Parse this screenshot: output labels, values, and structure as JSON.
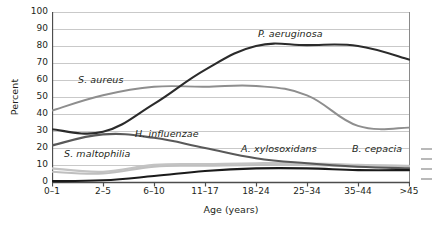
{
  "chart_data": {
    "type": "line",
    "title": "",
    "xlabel": "Age (years)",
    "ylabel": "Percent",
    "categories": [
      "0–1",
      "2–5",
      "6–10",
      "11–17",
      "18–24",
      "25–34",
      "35–44",
      ">45"
    ],
    "ylim": [
      0,
      100
    ],
    "yticks": [
      0,
      10,
      20,
      30,
      40,
      50,
      60,
      70,
      80,
      90,
      100
    ],
    "grid": true,
    "legend_position": "inline-annotations",
    "series": [
      {
        "name": "P. aeruginosa",
        "color": "#2b2b2b",
        "width": 2.1,
        "values": [
          31,
          29.5,
          46,
          66,
          80,
          80.5,
          80,
          72
        ],
        "label_x": 258,
        "label_y": 28
      },
      {
        "name": "S. aureus",
        "color": "#8e8e8e",
        "width": 1.9,
        "values": [
          42,
          51,
          56,
          56,
          56.5,
          51,
          33,
          32
        ],
        "label_x": 78,
        "label_y": 74
      },
      {
        "name": "H. influenzae",
        "color": "#595959",
        "width": 2.1,
        "values": [
          21.5,
          28,
          26,
          20,
          14,
          11,
          9,
          8
        ],
        "label_x": 135,
        "label_y": 128
      },
      {
        "name": "S. maltophilia",
        "color": "#c3c3c3",
        "width": 2.3,
        "values": [
          8,
          6,
          10,
          10.5,
          11,
          11,
          10,
          9.5
        ],
        "label_x": 64,
        "label_y": 148
      },
      {
        "name": "A. xylosoxidans",
        "color": "#bfbfbf",
        "width": 1.9,
        "values": [
          6,
          5,
          9,
          9.5,
          10,
          10,
          9,
          9
        ],
        "label_x": 241,
        "label_y": 143
      },
      {
        "name": "B. cepacia",
        "color": "#1a1a1a",
        "width": 2.1,
        "values": [
          0.5,
          1,
          3.5,
          6.5,
          8,
          8,
          7,
          7
        ],
        "label_x": 352,
        "label_y": 143
      }
    ]
  },
  "axes": {
    "y_axis_line_color": "#4d4d4d",
    "x_axis_line_color": "#4d4d4d",
    "grid_color": "#c9c9c9",
    "frame_right_color": "#8a8a8a"
  }
}
